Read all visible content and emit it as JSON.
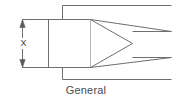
{
  "figure": {
    "caption": "General",
    "dimension_label": "X",
    "line_color": "#6e6e6e",
    "text_color": "#4a4a4a",
    "background_color": "#ffffff",
    "stroke_width": 1,
    "geometry": {
      "body_rect": {
        "x": 48,
        "y": 19,
        "width": 42,
        "height": 48
      },
      "triangle": {
        "base_x": 90,
        "top_y": 19,
        "bottom_y": 67,
        "apex_x": 132,
        "apex_y": 43
      },
      "dimension_line": {
        "x": 22,
        "y_top": 19,
        "y_bottom": 67
      },
      "extension_lines": [
        {
          "x1": 22,
          "y1": 19,
          "x2": 48,
          "y2": 19
        },
        {
          "x1": 22,
          "y1": 67,
          "x2": 48,
          "y2": 67
        }
      ],
      "step_lines": [
        {
          "points": "62,19 62,5 171,5"
        },
        {
          "points": "90,19 171,31"
        },
        {
          "points": "90,67 171,57"
        },
        {
          "points": "62,67 62,79 171,79"
        }
      ],
      "right_lines": [
        {
          "y": 5,
          "x1": 62,
          "x2": 171
        },
        {
          "y": 31,
          "x1": 132,
          "x2": 171
        },
        {
          "y": 57,
          "x1": 132,
          "x2": 171
        },
        {
          "y": 79,
          "x1": 62,
          "x2": 171
        }
      ]
    }
  }
}
